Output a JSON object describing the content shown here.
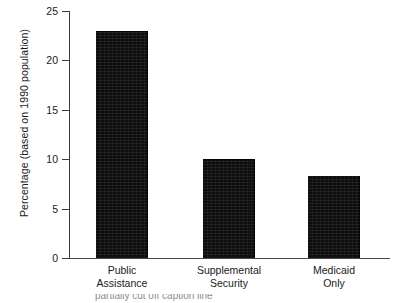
{
  "figure": {
    "background_color": "#ffffff",
    "bar_color": "#0d0d0d",
    "axis_color": "#3a3a3a",
    "text_color": "#1a1a1a"
  },
  "chart_data": {
    "type": "bar",
    "title": "",
    "subtitle": "",
    "xlabel": "",
    "ylabel": "Percentage (based on 1990 population)",
    "categories": [
      "Public Assistance",
      "Supplemental Security",
      "Medicaid Only"
    ],
    "category_lines": [
      [
        "Public",
        "Assistance"
      ],
      [
        "Supplemental",
        "Security"
      ],
      [
        "Medicaid",
        "Only"
      ]
    ],
    "values": [
      23.0,
      10.0,
      8.3
    ],
    "ylim": [
      0,
      25
    ],
    "yticks": [
      0,
      5,
      10,
      15,
      20,
      25
    ],
    "ytick_labels": [
      "0",
      "5",
      "10",
      "15",
      "20",
      "25"
    ],
    "grid": false,
    "legend": null,
    "orientation": "vertical"
  },
  "caption": {
    "clipped_text": "partially cut off caption line"
  }
}
